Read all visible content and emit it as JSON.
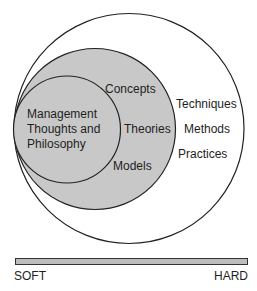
{
  "diagram": {
    "type": "nested-circles",
    "colors": {
      "background": "#ffffff",
      "stroke": "#222222",
      "inner_fill": "#c8c8c8",
      "bar_fill": "#bdbdbd"
    },
    "inner_circle": {
      "lines": [
        "Management",
        "Thoughts and",
        "Philosophy"
      ]
    },
    "middle_ring": {
      "items": [
        "Concepts",
        "Theories",
        "Models"
      ]
    },
    "outer_ring": {
      "items": [
        "Techniques",
        "Methods",
        "Practices"
      ]
    },
    "scale": {
      "left_label": "SOFT",
      "right_label": "HARD"
    }
  }
}
